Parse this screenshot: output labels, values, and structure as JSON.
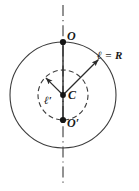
{
  "figure": {
    "background_color": "#ffffff",
    "stroke_color": "#333333",
    "text_color": "#1a1a1a",
    "labels": {
      "top_point": "O",
      "bottom_point": "O′",
      "center_point": "C",
      "outer_radius": "ℓ = R",
      "inner_radius": "ℓ′"
    },
    "geometry": {
      "center_x": 63,
      "center_y": 95,
      "outer_radius_px": 53,
      "inner_radius_px": 25,
      "axis_top_y": 5,
      "axis_bottom_y": 186,
      "outer_arrow_angle_deg": 45,
      "inner_arrow_angle_deg": 135
    },
    "elements": {
      "outer_circle": "solid-circle",
      "inner_circle": "dashed-circle",
      "vertical_axis": "dash-dot-axis-line",
      "chord_segment": "solid-segment-O-to-Oprime",
      "outer_radius_arrow": "arrow-from-center-to-outer-circle",
      "inner_radius_arrow": "arrow-from-center-to-inner-circle"
    }
  }
}
